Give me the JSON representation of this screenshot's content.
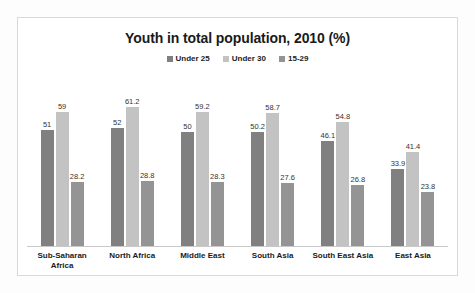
{
  "chart_data": {
    "type": "bar",
    "title": "Youth in total population, 2010 (%)",
    "xlabel": "",
    "ylabel": "",
    "ylim": [
      0,
      70
    ],
    "grid": false,
    "legend_position": "top-center",
    "categories": [
      "Sub-Saharan Africa",
      "North Africa",
      "Middle East",
      "South Asia",
      "South East Asia",
      "East Asia"
    ],
    "series": [
      {
        "name": "Under 25",
        "color": "#808080",
        "values": [
          51,
          52,
          50,
          50.2,
          46.1,
          33.9
        ],
        "labels": [
          "51",
          "52",
          "50",
          "50.2",
          "46.1",
          "33.9"
        ]
      },
      {
        "name": "Under 30",
        "color": "#c3c3c3",
        "values": [
          59,
          61.2,
          59.2,
          58.7,
          54.8,
          41.4
        ],
        "labels": [
          "59",
          "61.2",
          "59.2",
          "58.7",
          "54.8",
          "41.4"
        ]
      },
      {
        "name": "15-29",
        "color": "#949494",
        "values": [
          28.2,
          28.8,
          28.3,
          27.6,
          26.8,
          23.8
        ],
        "labels": [
          "28.2",
          "28.8",
          "28.3",
          "27.6",
          "26.8",
          "23.8"
        ]
      }
    ]
  }
}
